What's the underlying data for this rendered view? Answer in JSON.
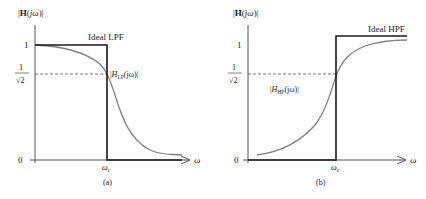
{
  "figure": {
    "panels": [
      {
        "id": "a",
        "caption": "(a)",
        "y_axis_label": {
          "open": "|",
          "bold": "H",
          "rest_open": "(",
          "j": "j",
          "omega": "ω",
          "close": ")|"
        },
        "tick_one": "1",
        "tick_sqrt_num": "1",
        "tick_sqrt_den": "√2",
        "tick_zero": "0",
        "x_tick": {
          "main": "ω",
          "sub": "c"
        },
        "x_axis_label": "ω",
        "ideal_label": "Ideal LPF",
        "curve_label": {
          "open": "|",
          "H": "H",
          "sub": "LP",
          "rest": "(jω)|"
        }
      },
      {
        "id": "b",
        "caption": "(b)",
        "y_axis_label": {
          "open": "|",
          "bold": "H",
          "rest_open": "(",
          "j": "j",
          "omega": "ω",
          "close": ")|"
        },
        "tick_one": "1",
        "tick_sqrt_num": "1",
        "tick_sqrt_den": "√2",
        "tick_zero": "0",
        "x_tick": {
          "main": "ω",
          "sub": "c"
        },
        "x_axis_label": "ω",
        "ideal_label": "Ideal HPF",
        "curve_label": {
          "open": "|",
          "H": "H",
          "sub": "HP",
          "rest": "(jω)|"
        }
      }
    ],
    "colors": {
      "ideal_line": "#1a1a1a",
      "real_curve": "#808080",
      "axis": "#555555",
      "dashed": "#555555"
    }
  }
}
